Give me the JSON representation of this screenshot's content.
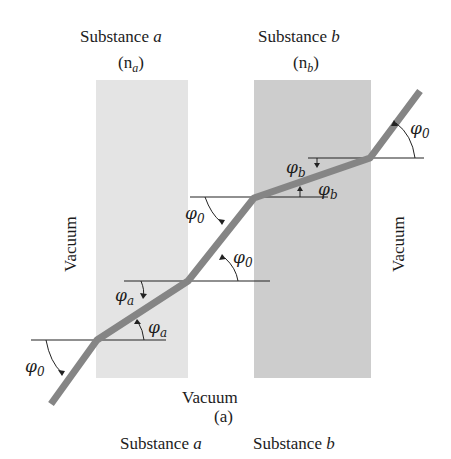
{
  "figure": {
    "caption": "(a)",
    "bottom_vacuum_label": "Vacuum",
    "left_vacuum_label": "Vacuum",
    "right_vacuum_label": "Vacuum",
    "substance_a": {
      "title": "Substance",
      "symbol": "a",
      "index_label_prefix": "(n",
      "index_label_sub": "a",
      "index_label_suffix": ")",
      "color": "#e4e4e4"
    },
    "substance_b": {
      "title": "Substance",
      "symbol": "b",
      "index_label_prefix": "(n",
      "index_label_sub": "b",
      "index_label_suffix": ")",
      "color": "#cdcdcd"
    },
    "angles": {
      "phi": "φ",
      "sub0": "0",
      "suba": "a",
      "subb": "b"
    },
    "ray_color": "#858585",
    "next_caption_a": "Substance",
    "next_caption_a_symbol": "a",
    "next_caption_b": "Substance",
    "next_caption_b_symbol": "b"
  }
}
